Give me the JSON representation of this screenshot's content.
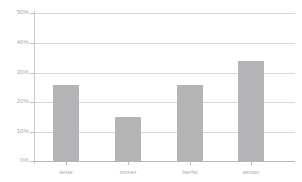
{
  "chart_data": {
    "type": "bar",
    "title": "",
    "xlabel": "",
    "ylabel": "",
    "categories": [
      "lente",
      "zomer",
      "herfst",
      "winter"
    ],
    "values": [
      26,
      15,
      26,
      34
    ],
    "value_labels": [
      "26%",
      "15%",
      "26%",
      "34%"
    ],
    "ylim": [
      0,
      50
    ],
    "ytick_values": [
      0,
      10,
      20,
      30,
      40,
      50
    ],
    "ytick_labels": [
      "0%",
      "10%",
      "20%",
      "30%",
      "40%",
      "50%"
    ],
    "grid": true,
    "grid_axis": "y",
    "legend": false,
    "legend_position": "none",
    "series": [
      {
        "name": "",
        "values": [
          26,
          15,
          26,
          34
        ]
      }
    ]
  },
  "style": {
    "bar_color": "#b4b4b6",
    "grid_color": "#d8d8d8",
    "axis_color": "#c9c9c9",
    "baseline_color": "#b9b9b9",
    "tick_label_color": "#a8a8a8",
    "background": "#ffffff"
  }
}
